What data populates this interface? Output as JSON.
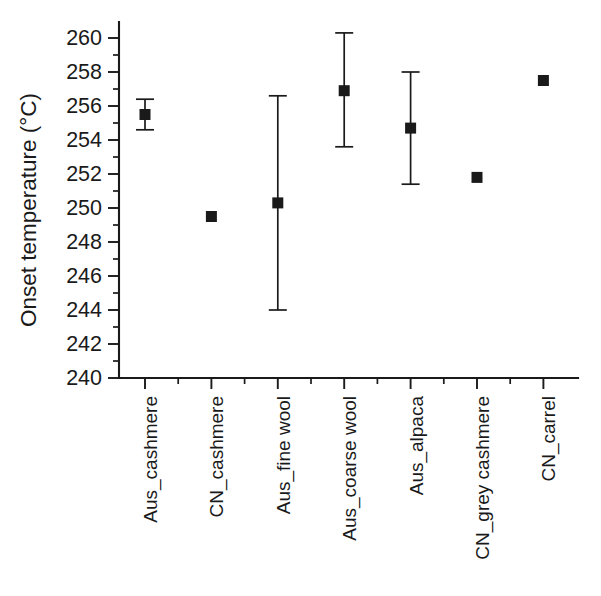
{
  "chart_data": {
    "type": "scatter",
    "title": "",
    "xlabel": "",
    "ylabel": "Onset temperature (°C)",
    "ylim": [
      240,
      260
    ],
    "ytick_step": 2,
    "yticks": [
      240,
      242,
      244,
      246,
      248,
      250,
      252,
      254,
      256,
      258,
      260
    ],
    "ytick_labels": [
      "240",
      "242",
      "244",
      "246",
      "248",
      "250",
      "252",
      "254",
      "256",
      "258",
      "260"
    ],
    "y_minor_ticks": true,
    "grid": false,
    "legend": "none",
    "marker": "filled-square",
    "marker_color": "#1a1a1a",
    "error_bars": "vertical-with-caps",
    "categories": [
      "Aus_cashmere",
      "CN_cashmere",
      "Aus_fine wool",
      "Aus_coarse wool",
      "Aus_alpaca",
      "CN_grey cashmere",
      "CN_carrel"
    ],
    "values": [
      255.5,
      249.5,
      250.3,
      256.9,
      254.7,
      251.8,
      257.5
    ],
    "err_upper": [
      256.4,
      249.5,
      256.6,
      260.3,
      258.0,
      251.8,
      257.5
    ],
    "err_lower": [
      254.6,
      249.5,
      244.0,
      253.6,
      251.4,
      251.8,
      257.5
    ],
    "points": [
      {
        "category": "Aus_cashmere",
        "value": 255.5,
        "upper": 256.4,
        "lower": 254.6,
        "has_error_bar": true
      },
      {
        "category": "CN_cashmere",
        "value": 249.5,
        "upper": 249.5,
        "lower": 249.5,
        "has_error_bar": false
      },
      {
        "category": "Aus_fine wool",
        "value": 250.3,
        "upper": 256.6,
        "lower": 244.0,
        "has_error_bar": true
      },
      {
        "category": "Aus_coarse wool",
        "value": 256.9,
        "upper": 260.3,
        "lower": 253.6,
        "has_error_bar": true
      },
      {
        "category": "Aus_alpaca",
        "value": 254.7,
        "upper": 258.0,
        "lower": 251.4,
        "has_error_bar": true
      },
      {
        "category": "CN_grey cashmere",
        "value": 251.8,
        "upper": 251.8,
        "lower": 251.8,
        "has_error_bar": false
      },
      {
        "category": "CN_carrel",
        "value": 257.5,
        "upper": 257.5,
        "lower": 257.5,
        "has_error_bar": false
      }
    ]
  }
}
